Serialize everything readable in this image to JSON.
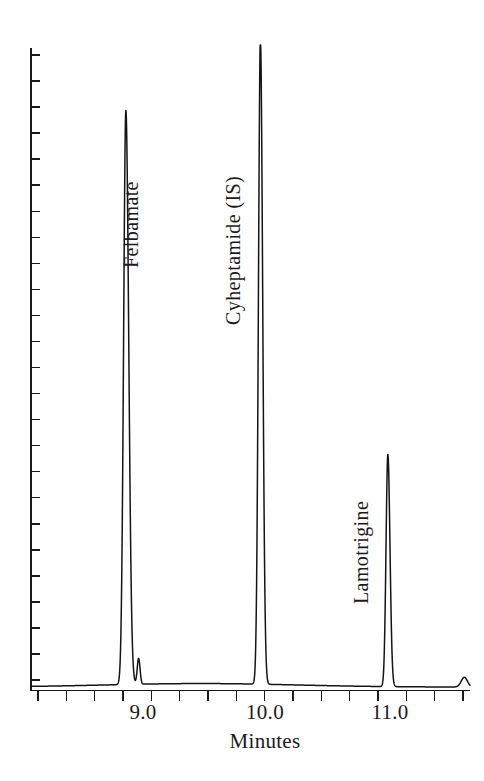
{
  "chart_data": {
    "type": "line",
    "title": "",
    "subtitle": "",
    "xlabel": "Minutes",
    "ylabel": "",
    "xlim": [
      8.35,
      11.45
    ],
    "ylim": [
      0,
      100
    ],
    "grid": false,
    "legend": "none",
    "x_tick_labels": [
      "9.0",
      "10.0",
      "11.0"
    ],
    "x_tick_values": [
      9.0,
      10.0,
      11.0
    ],
    "x_minor_tick_interval": 0.2,
    "y_axis_ticks_unlabeled": 25,
    "annotations": [
      {
        "label": "Felbamate",
        "x": 9.02
      },
      {
        "label": "Cyheptamide (IS)",
        "x": 9.97
      },
      {
        "label": "Lamotrigine",
        "x": 10.87
      }
    ],
    "peaks": [
      {
        "name": "Felbamate",
        "retention_time": 9.02,
        "height": 89
      },
      {
        "name": "unknown-shoulder",
        "retention_time": 9.11,
        "height": 4
      },
      {
        "name": "Cyheptamide (IS)",
        "retention_time": 9.97,
        "height": 100
      },
      {
        "name": "Lamotrigine",
        "retention_time": 10.87,
        "height": 36
      },
      {
        "name": "unknown-trace",
        "retention_time": 11.41,
        "height": 1.5
      }
    ],
    "baseline": 0,
    "series": [
      {
        "name": "detector-signal",
        "values": [
          89,
          4,
          100,
          36,
          1.5
        ]
      }
    ]
  },
  "axis": {
    "x_labels": [
      {
        "text": "9.0",
        "x_px": 143
      },
      {
        "text": "10.0",
        "x_px": 265
      },
      {
        "text": "11.0",
        "x_px": 390
      }
    ],
    "x_title": "Minutes"
  },
  "peak_labels": [
    {
      "text": "Felbamate",
      "x_px": 120,
      "y_px": 268
    },
    {
      "text": "Cyheptamide (IS)",
      "x_px": 222,
      "y_px": 325
    },
    {
      "text": "Lamotrigine",
      "x_px": 350,
      "y_px": 604
    }
  ],
  "colors": {
    "trace": "#141414",
    "axis": "#1a1a1a",
    "background": "#ffffff"
  }
}
